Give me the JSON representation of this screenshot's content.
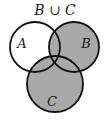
{
  "diagram": {
    "type": "venn",
    "title": "B ∪ C",
    "shaded_region": "B ∪ C",
    "colors": {
      "shade": "#a9a9a9",
      "outline": "#111111",
      "background": "#ffffff"
    },
    "sets": [
      {
        "id": "A",
        "label": "A",
        "shaded": false
      },
      {
        "id": "B",
        "label": "B",
        "shaded": true
      },
      {
        "id": "C",
        "label": "C",
        "shaded": true
      }
    ]
  }
}
